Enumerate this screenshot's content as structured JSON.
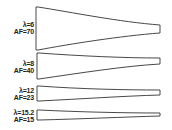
{
  "diagram": {
    "type": "blade-planforms",
    "stroke_color": "#333333",
    "blades": [
      {
        "lambda_label": "λ=6",
        "af_label": "AF=70",
        "lambda": 6,
        "af": 70
      },
      {
        "lambda_label": "λ=8",
        "af_label": "AF=40",
        "lambda": 8,
        "af": 40
      },
      {
        "lambda_label": "λ=12",
        "af_label": "AF=23",
        "lambda": 12,
        "af": 23
      },
      {
        "lambda_label": "λ=15.2",
        "af_label": "AF=15",
        "lambda": 15.2,
        "af": 15
      }
    ]
  }
}
